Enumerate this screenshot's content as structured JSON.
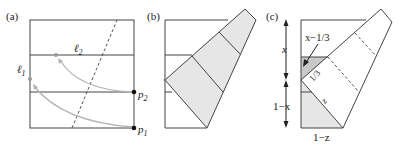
{
  "figure": {
    "panels": [
      {
        "label": "(a)",
        "annotations": {
          "line_l1": "ℓ",
          "line_l1_sub": "1",
          "line_l2": "ℓ",
          "line_l2_sub": "2",
          "point_p1": "p",
          "point_p1_sub": "1",
          "point_p2": "p",
          "point_p2_sub": "2"
        }
      },
      {
        "label": "(b)"
      },
      {
        "label": "(c)",
        "annotations": {
          "top_length": "x",
          "bottom_length": "1−x",
          "offset": "x−1/3",
          "third": "1/3",
          "fold_edge": "z",
          "base": "1−z"
        }
      }
    ],
    "colors": {
      "stroke": "#444444",
      "shade_light": "#e6e6e6",
      "shade_dark": "#c9c9c9",
      "arc": "#b5b5b5",
      "point": "#111111"
    }
  }
}
